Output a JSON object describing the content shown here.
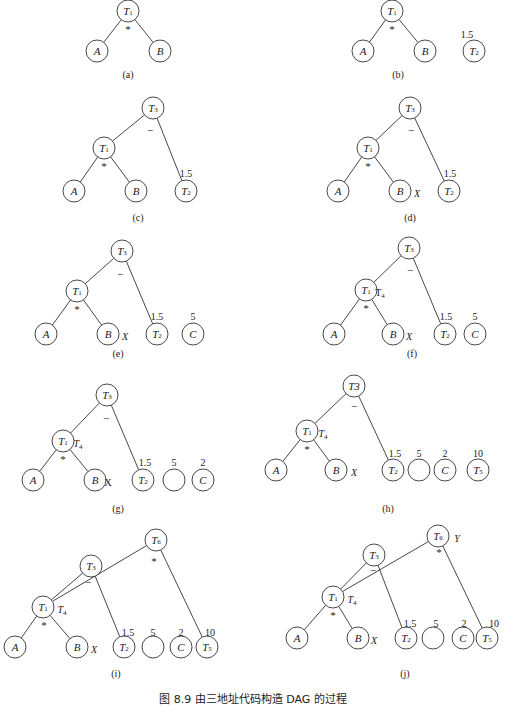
{
  "figure": {
    "caption": "图 8.9  由三地址代码构造 DAG 的过程",
    "node_radius": 11,
    "stroke_color": "#333333",
    "panels": [
      {
        "id": "a",
        "caption": "(a)",
        "caption_pos": [
          128,
          78
        ],
        "nodes": [
          {
            "id": "T1",
            "label": "T",
            "sub": "1",
            "x": 128,
            "y": 11
          },
          {
            "id": "A",
            "label": "A",
            "sub": "",
            "x": 97,
            "y": 51
          },
          {
            "id": "B",
            "label": "B",
            "sub": "",
            "x": 160,
            "y": 51
          }
        ],
        "edges": [
          [
            "T1",
            "A"
          ],
          [
            "T1",
            "B"
          ]
        ],
        "ops": [
          {
            "text": "*",
            "x": 128,
            "y": 29
          }
        ],
        "annotations": []
      },
      {
        "id": "b",
        "caption": "(b)",
        "caption_pos": [
          398,
          78
        ],
        "nodes": [
          {
            "id": "T1",
            "label": "T",
            "sub": "1",
            "x": 392,
            "y": 11
          },
          {
            "id": "A",
            "label": "A",
            "sub": "",
            "x": 363,
            "y": 51
          },
          {
            "id": "B",
            "label": "B",
            "sub": "",
            "x": 425,
            "y": 51
          },
          {
            "id": "T2",
            "label": "T",
            "sub": "2",
            "x": 474,
            "y": 51
          }
        ],
        "edges": [
          [
            "T1",
            "A"
          ],
          [
            "T1",
            "B"
          ]
        ],
        "ops": [
          {
            "text": "*",
            "x": 392,
            "y": 29
          }
        ],
        "annotations": [
          {
            "text": "1.5",
            "x": 467,
            "y": 35,
            "italic": false
          }
        ]
      },
      {
        "id": "c",
        "caption": "(c)",
        "caption_pos": [
          138,
          221
        ],
        "nodes": [
          {
            "id": "T3",
            "label": "T",
            "sub": "3",
            "x": 153,
            "y": 108
          },
          {
            "id": "T1",
            "label": "T",
            "sub": "1",
            "x": 104,
            "y": 148
          },
          {
            "id": "A",
            "label": "A",
            "sub": "",
            "x": 74,
            "y": 191
          },
          {
            "id": "B",
            "label": "B",
            "sub": "",
            "x": 136,
            "y": 191
          },
          {
            "id": "T2",
            "label": "T",
            "sub": "2",
            "x": 186,
            "y": 191
          }
        ],
        "edges": [
          [
            "T3",
            "T1"
          ],
          [
            "T3",
            "T2"
          ],
          [
            "T1",
            "A"
          ],
          [
            "T1",
            "B"
          ]
        ],
        "ops": [
          {
            "text": "−",
            "x": 150,
            "y": 130
          },
          {
            "text": "*",
            "x": 104,
            "y": 166
          }
        ],
        "annotations": [
          {
            "text": "1.5",
            "x": 186,
            "y": 174,
            "italic": false
          }
        ]
      },
      {
        "id": "d",
        "caption": "(d)",
        "caption_pos": [
          410,
          221
        ],
        "nodes": [
          {
            "id": "T3",
            "label": "T",
            "sub": "3",
            "x": 410,
            "y": 108
          },
          {
            "id": "T1",
            "label": "T",
            "sub": "1",
            "x": 368,
            "y": 148
          },
          {
            "id": "A",
            "label": "A",
            "sub": "",
            "x": 338,
            "y": 191
          },
          {
            "id": "B",
            "label": "B",
            "sub": "",
            "x": 400,
            "y": 191
          },
          {
            "id": "T2",
            "label": "T",
            "sub": "2",
            "x": 449,
            "y": 191
          }
        ],
        "edges": [
          [
            "T3",
            "T1"
          ],
          [
            "T3",
            "T2"
          ],
          [
            "T1",
            "A"
          ],
          [
            "T1",
            "B"
          ]
        ],
        "ops": [
          {
            "text": "−",
            "x": 411,
            "y": 130
          },
          {
            "text": "*",
            "x": 368,
            "y": 166
          }
        ],
        "annotations": [
          {
            "text": "X",
            "x": 417,
            "y": 194,
            "italic": true
          },
          {
            "text": "1.5",
            "x": 450,
            "y": 174,
            "italic": false
          }
        ]
      },
      {
        "id": "e",
        "caption": "(e)",
        "caption_pos": [
          118,
          357
        ],
        "nodes": [
          {
            "id": "T3",
            "label": "T",
            "sub": "3",
            "x": 122,
            "y": 251
          },
          {
            "id": "T1",
            "label": "T",
            "sub": "1",
            "x": 77,
            "y": 291
          },
          {
            "id": "A",
            "label": "A",
            "sub": "",
            "x": 46,
            "y": 334
          },
          {
            "id": "B",
            "label": "B",
            "sub": "",
            "x": 108,
            "y": 334
          },
          {
            "id": "T2",
            "label": "T",
            "sub": "2",
            "x": 157,
            "y": 334
          },
          {
            "id": "C",
            "label": "C",
            "sub": "",
            "x": 193,
            "y": 334
          }
        ],
        "edges": [
          [
            "T3",
            "T1"
          ],
          [
            "T3",
            "T2"
          ],
          [
            "T1",
            "A"
          ],
          [
            "T1",
            "B"
          ]
        ],
        "ops": [
          {
            "text": "−",
            "x": 120,
            "y": 274
          },
          {
            "text": "*",
            "x": 77,
            "y": 309
          }
        ],
        "annotations": [
          {
            "text": "X",
            "x": 125,
            "y": 337,
            "italic": true
          },
          {
            "text": "1.5",
            "x": 157,
            "y": 317,
            "italic": false
          },
          {
            "text": "5",
            "x": 193,
            "y": 317,
            "italic": false
          }
        ]
      },
      {
        "id": "f",
        "caption": "(f)",
        "caption_pos": [
          412,
          357
        ],
        "nodes": [
          {
            "id": "T3",
            "label": "T",
            "sub": "3",
            "x": 409,
            "y": 248
          },
          {
            "id": "T1",
            "label": "T",
            "sub": "1",
            "x": 366,
            "y": 290
          },
          {
            "id": "A",
            "label": "A",
            "sub": "",
            "x": 334,
            "y": 334
          },
          {
            "id": "B",
            "label": "B",
            "sub": "",
            "x": 393,
            "y": 334
          },
          {
            "id": "T2",
            "label": "T",
            "sub": "2",
            "x": 445,
            "y": 334
          },
          {
            "id": "C",
            "label": "C",
            "sub": "",
            "x": 475,
            "y": 334
          }
        ],
        "edges": [
          [
            "T3",
            "T1"
          ],
          [
            "T3",
            "T2"
          ],
          [
            "T1",
            "A"
          ],
          [
            "T1",
            "B"
          ]
        ],
        "ops": [
          {
            "text": "−",
            "x": 410,
            "y": 270
          },
          {
            "text": "*",
            "x": 366,
            "y": 308
          }
        ],
        "annotations": [
          {
            "text": "T",
            "sub": "4",
            "x": 380,
            "y": 293,
            "italic": false
          },
          {
            "text": "X",
            "x": 409,
            "y": 337,
            "italic": true
          },
          {
            "text": "1.5",
            "x": 446,
            "y": 317,
            "italic": false
          },
          {
            "text": "5",
            "x": 475,
            "y": 317,
            "italic": false
          }
        ]
      },
      {
        "id": "g",
        "caption": "(g)",
        "caption_pos": [
          118,
          512
        ],
        "nodes": [
          {
            "id": "T3",
            "label": "T",
            "sub": "3",
            "x": 107,
            "y": 395
          },
          {
            "id": "T1",
            "label": "T",
            "sub": "1",
            "x": 63,
            "y": 441
          },
          {
            "id": "A",
            "label": "A",
            "sub": "",
            "x": 33,
            "y": 480
          },
          {
            "id": "B",
            "label": "B",
            "sub": "",
            "x": 95,
            "y": 480
          },
          {
            "id": "T2",
            "label": "T",
            "sub": "2",
            "x": 143,
            "y": 480
          },
          {
            "id": "E",
            "label": "",
            "sub": "",
            "x": 174,
            "y": 480
          },
          {
            "id": "C",
            "label": "C",
            "sub": "",
            "x": 203,
            "y": 480
          }
        ],
        "edges": [
          [
            "T3",
            "T1"
          ],
          [
            "T3",
            "T2"
          ],
          [
            "T1",
            "A"
          ],
          [
            "T1",
            "B"
          ]
        ],
        "ops": [
          {
            "text": "−",
            "x": 106,
            "y": 418
          },
          {
            "text": "*",
            "x": 63,
            "y": 459
          }
        ],
        "annotations": [
          {
            "text": "T",
            "sub": "4",
            "x": 78,
            "y": 444,
            "italic": true
          },
          {
            "text": "X",
            "x": 108,
            "y": 483,
            "italic": false
          },
          {
            "text": "1.5",
            "x": 145,
            "y": 463,
            "italic": false
          },
          {
            "text": "5",
            "x": 174,
            "y": 463,
            "italic": false
          },
          {
            "text": "2",
            "x": 203,
            "y": 463,
            "italic": false
          }
        ]
      },
      {
        "id": "h",
        "caption": "(h)",
        "caption_pos": [
          388,
          512
        ],
        "nodes": [
          {
            "id": "T3",
            "label": "T3",
            "sub": "",
            "x": 354,
            "y": 386
          },
          {
            "id": "T1",
            "label": "T",
            "sub": "1",
            "x": 307,
            "y": 431
          },
          {
            "id": "A",
            "label": "A",
            "sub": "",
            "x": 276,
            "y": 470
          },
          {
            "id": "B",
            "label": "B",
            "sub": "",
            "x": 336,
            "y": 470
          },
          {
            "id": "T2",
            "label": "T",
            "sub": "2",
            "x": 393,
            "y": 470
          },
          {
            "id": "E",
            "label": "",
            "sub": "",
            "x": 419,
            "y": 470
          },
          {
            "id": "C",
            "label": "C",
            "sub": "",
            "x": 445,
            "y": 470
          },
          {
            "id": "T5",
            "label": "T",
            "sub": "5",
            "x": 478,
            "y": 470
          }
        ],
        "edges": [
          [
            "T3",
            "T1"
          ],
          [
            "T3",
            "T2"
          ],
          [
            "T1",
            "A"
          ],
          [
            "T1",
            "B"
          ]
        ],
        "ops": [
          {
            "text": "−",
            "x": 354,
            "y": 406
          },
          {
            "text": "*",
            "x": 307,
            "y": 449
          }
        ],
        "annotations": [
          {
            "text": "T",
            "sub": "4",
            "x": 323,
            "y": 434,
            "italic": true
          },
          {
            "text": "X",
            "x": 354,
            "y": 473,
            "italic": true
          },
          {
            "text": "1.5",
            "x": 395,
            "y": 454,
            "italic": false
          },
          {
            "text": "5",
            "x": 419,
            "y": 454,
            "italic": false
          },
          {
            "text": "2",
            "x": 445,
            "y": 454,
            "italic": false
          },
          {
            "text": "10",
            "x": 478,
            "y": 454,
            "italic": false
          }
        ]
      },
      {
        "id": "i",
        "caption": "(i)",
        "caption_pos": [
          116,
          677
        ],
        "nodes": [
          {
            "id": "T6",
            "label": "T",
            "sub": "6",
            "x": 156,
            "y": 540
          },
          {
            "id": "T3",
            "label": "T",
            "sub": "3",
            "x": 91,
            "y": 566
          },
          {
            "id": "T1",
            "label": "T",
            "sub": "1",
            "x": 43,
            "y": 607
          },
          {
            "id": "A",
            "label": "A",
            "sub": "",
            "x": 15,
            "y": 647
          },
          {
            "id": "B",
            "label": "B",
            "sub": "",
            "x": 77,
            "y": 647
          },
          {
            "id": "T2",
            "label": "T",
            "sub": "2",
            "x": 124,
            "y": 647
          },
          {
            "id": "E",
            "label": "",
            "sub": "",
            "x": 153,
            "y": 647
          },
          {
            "id": "C",
            "label": "C",
            "sub": "",
            "x": 181,
            "y": 647
          },
          {
            "id": "T5",
            "label": "T",
            "sub": "5",
            "x": 207,
            "y": 647
          }
        ],
        "edges": [
          [
            "T6",
            "T1"
          ],
          [
            "T6",
            "T5"
          ],
          [
            "T3",
            "T1"
          ],
          [
            "T3",
            "T2"
          ],
          [
            "T1",
            "A"
          ],
          [
            "T1",
            "B"
          ]
        ],
        "ops": [
          {
            "text": "*",
            "x": 154,
            "y": 561
          },
          {
            "text": "−",
            "x": 88,
            "y": 582
          },
          {
            "text": "*",
            "x": 44,
            "y": 625
          }
        ],
        "annotations": [
          {
            "text": "T",
            "sub": "4",
            "x": 62,
            "y": 610,
            "italic": true
          },
          {
            "text": "X",
            "x": 94,
            "y": 650,
            "italic": true
          },
          {
            "text": "1.5",
            "x": 128,
            "y": 633,
            "italic": false
          },
          {
            "text": "5",
            "x": 153,
            "y": 633,
            "italic": false
          },
          {
            "text": "2",
            "x": 181,
            "y": 633,
            "italic": false
          },
          {
            "text": "10",
            "x": 210,
            "y": 633,
            "italic": false
          }
        ]
      },
      {
        "id": "j",
        "caption": "(j)",
        "caption_pos": [
          405,
          677
        ],
        "nodes": [
          {
            "id": "T6",
            "label": "T",
            "sub": "6",
            "x": 438,
            "y": 536
          },
          {
            "id": "T3",
            "label": "T",
            "sub": "3",
            "x": 374,
            "y": 555
          },
          {
            "id": "T1",
            "label": "T",
            "sub": "1",
            "x": 333,
            "y": 597
          },
          {
            "id": "A",
            "label": "A",
            "sub": "",
            "x": 297,
            "y": 638
          },
          {
            "id": "B",
            "label": "B",
            "sub": "",
            "x": 358,
            "y": 638
          },
          {
            "id": "T2",
            "label": "T",
            "sub": "2",
            "x": 406,
            "y": 638
          },
          {
            "id": "E",
            "label": "",
            "sub": "",
            "x": 433,
            "y": 638
          },
          {
            "id": "C",
            "label": "C",
            "sub": "",
            "x": 463,
            "y": 638
          },
          {
            "id": "T5",
            "label": "T",
            "sub": "5",
            "x": 487,
            "y": 638
          }
        ],
        "edges": [
          [
            "T6",
            "T1"
          ],
          [
            "T6",
            "T5"
          ],
          [
            "T3",
            "T1"
          ],
          [
            "T3",
            "T2"
          ],
          [
            "T1",
            "A"
          ],
          [
            "T1",
            "B"
          ]
        ],
        "ops": [
          {
            "text": "*",
            "x": 439,
            "y": 552
          },
          {
            "text": "−",
            "x": 373,
            "y": 570
          },
          {
            "text": "*",
            "x": 333,
            "y": 615
          }
        ],
        "annotations": [
          {
            "text": "Y",
            "x": 457,
            "y": 539,
            "italic": true
          },
          {
            "text": "T",
            "sub": "4",
            "x": 352,
            "y": 600,
            "italic": true
          },
          {
            "text": "X",
            "x": 374,
            "y": 641,
            "italic": true
          },
          {
            "text": "1.5",
            "x": 410,
            "y": 624,
            "italic": false
          },
          {
            "text": "5",
            "x": 436,
            "y": 624,
            "italic": false
          },
          {
            "text": "2",
            "x": 464,
            "y": 624,
            "italic": false
          },
          {
            "text": "10",
            "x": 494,
            "y": 624,
            "italic": false
          }
        ]
      }
    ]
  }
}
